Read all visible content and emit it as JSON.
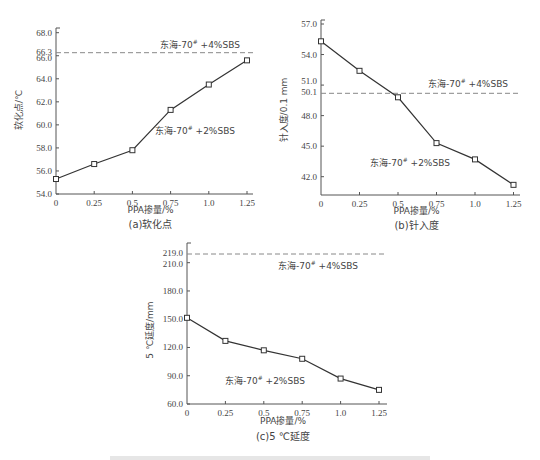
{
  "chart_data": [
    {
      "id": "a",
      "type": "line",
      "title": "(a)软化点",
      "xlabel": "PPA掺量/%",
      "ylabel": "软化点/℃",
      "categories": [
        "0",
        "0.25",
        "0.5",
        "0.75",
        "1.0",
        "1.25"
      ],
      "x": [
        0,
        0.25,
        0.5,
        0.75,
        1.0,
        1.25
      ],
      "y_ticks": [
        54.0,
        56.0,
        58.0,
        60.0,
        62.0,
        64.0,
        66.0,
        66.3,
        68.0
      ],
      "y_tick_labels": [
        "54.0",
        "56.0",
        "58.0",
        "60.0",
        "62.0",
        "64.0",
        "66.0",
        "66.3",
        "68.0"
      ],
      "ylim": [
        54.0,
        68.0
      ],
      "grid": false,
      "series": [
        {
          "name": "东海-70# +2%SBS",
          "label_main": "东海-70",
          "label_sup": "#",
          "label_tail": " +2%SBS",
          "values": [
            55.3,
            56.6,
            57.8,
            61.3,
            63.5,
            65.6
          ],
          "style": "solid",
          "marker": "square"
        }
      ],
      "reference_lines": [
        {
          "name": "东海-70# +4%SBS",
          "label_main": "东海-70",
          "label_sup": "#",
          "label_tail": " +4%SBS",
          "value": 66.3,
          "style": "dashed"
        }
      ]
    },
    {
      "id": "b",
      "type": "line",
      "title": "(b)针入度",
      "xlabel": "PPA掺量/%",
      "ylabel": "针入度/0.1 mm",
      "categories": [
        "0",
        "0.25",
        "0.5",
        "0.75",
        "1.0",
        "1.25"
      ],
      "x": [
        0,
        0.25,
        0.5,
        0.75,
        1.0,
        1.25
      ],
      "y_ticks": [
        42.0,
        45.0,
        48.0,
        50.1,
        51.0,
        54.0,
        57.0
      ],
      "y_tick_labels": [
        "42.0",
        "45.0",
        "48.0",
        "50.1",
        "51.0",
        "54.0",
        "57.0"
      ],
      "ylim": [
        40.2,
        57.0
      ],
      "grid": false,
      "series": [
        {
          "name": "东海-70# +2%SBS",
          "label_main": "东海-70",
          "label_sup": "#",
          "label_tail": " +2%SBS",
          "values": [
            55.3,
            52.4,
            49.8,
            45.3,
            43.7,
            41.2
          ],
          "style": "solid",
          "marker": "square"
        }
      ],
      "reference_lines": [
        {
          "name": "东海-70# +4%SBS",
          "label_main": "东海-70",
          "label_sup": "#",
          "label_tail": " +4%SBS",
          "value": 50.1,
          "style": "dashed"
        }
      ]
    },
    {
      "id": "c",
      "type": "line",
      "title": "(c)5 ℃延度",
      "xlabel": "PPA掺量/%",
      "ylabel": "5 ℃延度/mm",
      "categories": [
        "0",
        "0.25",
        "0.5",
        "0.75",
        "1.0",
        "1.25"
      ],
      "x": [
        0,
        0.25,
        0.5,
        0.75,
        1.0,
        1.25
      ],
      "y_ticks": [
        60.0,
        90.0,
        120.0,
        150.0,
        180.0,
        210.0,
        219.0
      ],
      "y_tick_labels": [
        "60.0",
        "90.0",
        "120.0",
        "150.0",
        "180.0",
        "210.0",
        "219.0"
      ],
      "ylim": [
        60.0,
        230.0
      ],
      "grid": false,
      "series": [
        {
          "name": "东海-70# +2%SBS",
          "label_main": "东海-70",
          "label_sup": "#",
          "label_tail": " +2%SBS",
          "values": [
            151.5,
            127.0,
            117.0,
            108.0,
            87.0,
            75.0
          ],
          "style": "solid",
          "marker": "square"
        }
      ],
      "reference_lines": [
        {
          "name": "东海-70# +4%SBS",
          "label_main": "东海-70",
          "label_sup": "#",
          "label_tail": " +4%SBS",
          "value": 219.0,
          "style": "dashed"
        }
      ]
    }
  ],
  "colors": {
    "line": "#333333",
    "axis": "#555555",
    "dashed": "#888888",
    "text": "#444444"
  }
}
